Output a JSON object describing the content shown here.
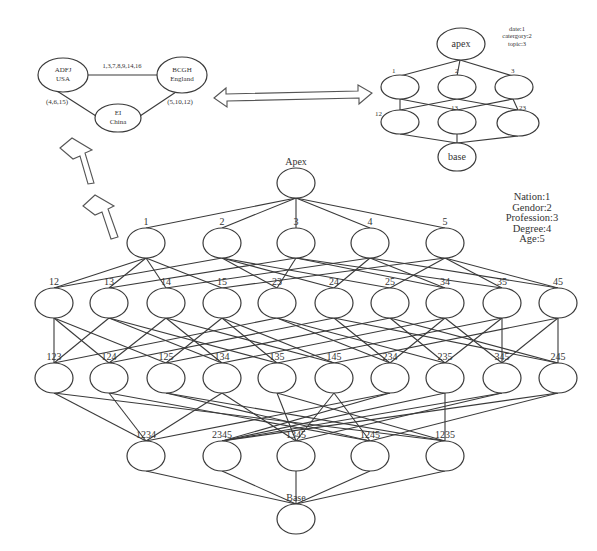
{
  "small_graph": {
    "nodes": [
      {
        "id": "usa",
        "line1": "ADFJ",
        "line2": "USA",
        "cx": 63,
        "cy": 75
      },
      {
        "id": "england",
        "line1": "BCGH",
        "line2": "England",
        "cx": 182,
        "cy": 75
      },
      {
        "id": "china",
        "line1": "EI",
        "line2": "China",
        "cx": 118,
        "cy": 118
      }
    ],
    "edge_labels": {
      "usa_england": "1,3,7,8,9,14,16",
      "usa_china": "(4,6,15)",
      "england_china": "(5,10,12)"
    }
  },
  "small_lattice": {
    "apex_label": "apex",
    "base_label": "base",
    "row1_labels": [
      "1",
      "2",
      "3"
    ],
    "row2_labels": [
      "12",
      "13",
      "23"
    ],
    "legend": [
      "date:1",
      "catergory:2",
      "topic:3"
    ]
  },
  "main_lattice": {
    "apex_label": "Apex",
    "base_label": "Base",
    "row1_labels": [
      "1",
      "2",
      "3",
      "4",
      "5"
    ],
    "row2_labels": [
      "12",
      "13",
      "14",
      "15",
      "23",
      "24",
      "25",
      "34",
      "35",
      "45"
    ],
    "row3_labels": [
      "123",
      "124",
      "125",
      "134",
      "135",
      "145",
      "234",
      "235",
      "345",
      "245"
    ],
    "row4_labels": [
      "1234",
      "2345",
      "1345",
      "1245",
      "1235"
    ],
    "legend": [
      "Nation:1",
      "Gendor:2",
      "Profession:3",
      "Degree:4",
      "Age:5"
    ]
  },
  "arrows": {
    "double_arrow": "bidirectional-arrow",
    "up_arrows": [
      "up-arrow",
      "up-arrow"
    ]
  }
}
